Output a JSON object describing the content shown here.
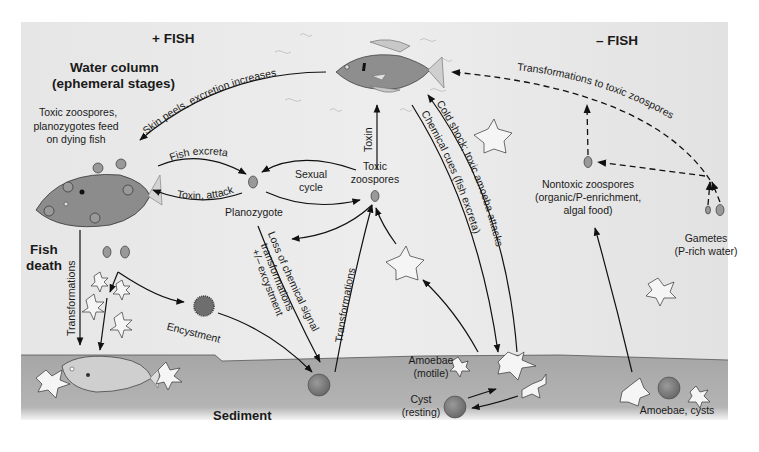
{
  "figure": {
    "headers": {
      "plus_fish": "+ FISH",
      "minus_fish": "– FISH",
      "water_column_line1": "Water column",
      "water_column_line2": "(ephemeral stages)",
      "fish_death_line1": "Fish",
      "fish_death_line2": "death",
      "sediment": "Sediment"
    },
    "labels": {
      "feed_line1": "Toxic zoospores,",
      "feed_line2": "planozygotes feed",
      "feed_line3": "on dying fish",
      "planozygote": "Planozygote",
      "sexual_cycle_line1": "Sexual",
      "sexual_cycle_line2": "cycle",
      "toxic_zoospores_line1": "Toxic",
      "toxic_zoospores_line2": "zoospores",
      "nontoxic_line1": "Nontoxic zoospores",
      "nontoxic_line2": "(organic/P-enrichment,",
      "nontoxic_line3": "algal food)",
      "gametes_line1": "Gametes",
      "gametes_line2": "(P-rich water)",
      "amoebae_motile_line1": "Amoebae",
      "amoebae_motile_line2": "(motile)",
      "cyst_line1": "Cyst",
      "cyst_line2": "(resting)",
      "amoebae_cysts": "Amoebae, cysts",
      "encystment": "Encystment"
    },
    "arrow_labels": {
      "skin_peels": "Skin peels, excretion increases",
      "fish_excreta": "Fish excreta",
      "toxin_attack": "Toxin, attack",
      "toxin": "Toxin",
      "transformations_left": "Transformations",
      "transformations_mid": "Transformations",
      "loss_signal_line1": "Loss of chemical signal",
      "loss_signal_line2": "transformations",
      "loss_signal_line3": "+/– excystment",
      "chemical_cues": "Chemical cues (fish excreta)",
      "cold_shock": "Cold shock; toxic amoeba attacks",
      "to_toxic": "Transformations to toxic zoospores"
    },
    "colors": {
      "water": "#e9e9e9",
      "sediment": "#a9a9a9",
      "fish_body": "#8e8e8e",
      "arrow": "#111111",
      "cyst": "#7a7a7a"
    }
  }
}
